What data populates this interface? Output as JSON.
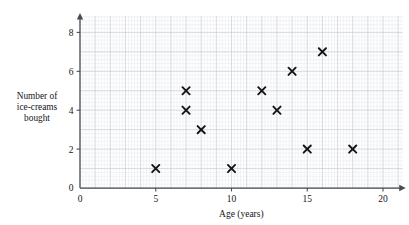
{
  "chart_data": {
    "type": "scatter",
    "title": "",
    "xlabel": "Age (years)",
    "ylabel": "Number of ice-creams bought",
    "ylabel_lines": [
      "Number of",
      "ice-creams",
      "bought"
    ],
    "xlim": [
      0,
      21.5
    ],
    "ylim": [
      0,
      8.9
    ],
    "xticks": [
      0,
      5,
      10,
      15,
      20
    ],
    "yticks": [
      0,
      2,
      4,
      6,
      8
    ],
    "xticklabels": [
      "0",
      "5",
      "10",
      "15",
      "20"
    ],
    "yticklabels": [
      "0",
      "2",
      "4",
      "6",
      "8"
    ],
    "grid": true,
    "grid_major_step_x": 1,
    "grid_major_step_y": 1,
    "grid_minor_divisions": 5,
    "legend": "none",
    "marker": "x",
    "marker_color": "#141418",
    "grid_major_color": "#c8ccd4",
    "grid_minor_color": "#e6e9ee",
    "axis_color": "#4a4a52",
    "points": [
      {
        "x": 5,
        "y": 1
      },
      {
        "x": 7,
        "y": 5
      },
      {
        "x": 7,
        "y": 4
      },
      {
        "x": 8,
        "y": 3
      },
      {
        "x": 10,
        "y": 1
      },
      {
        "x": 12,
        "y": 5
      },
      {
        "x": 13,
        "y": 4
      },
      {
        "x": 14,
        "y": 6
      },
      {
        "x": 15,
        "y": 2
      },
      {
        "x": 16,
        "y": 7
      },
      {
        "x": 18,
        "y": 2
      }
    ]
  }
}
